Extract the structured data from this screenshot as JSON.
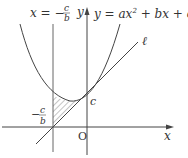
{
  "diagram": {
    "labels": {
      "vertical_line_lhs": "x = −",
      "vertical_line_frac_num": "c",
      "vertical_line_frac_den": "b",
      "y_axis": "y",
      "curve_eq": "y = ax",
      "curve_eq_exp": "2",
      "curve_eq_rest": " + bx + c",
      "tangent_line": "ℓ",
      "c_label": "c",
      "neg_label_minus": "−",
      "neg_label_num": "c",
      "neg_label_den": "b",
      "origin": "O",
      "x_axis": "x"
    },
    "colors": {
      "stroke": "#444444",
      "hatch": "#555555",
      "background": "#ffffff"
    },
    "elements": [
      "parabola y = ax^2 + bx + c",
      "tangent line ℓ at y-intercept c",
      "vertical line x = -c/b",
      "shaded region between parabola, ℓ and x = -c/b"
    ]
  }
}
